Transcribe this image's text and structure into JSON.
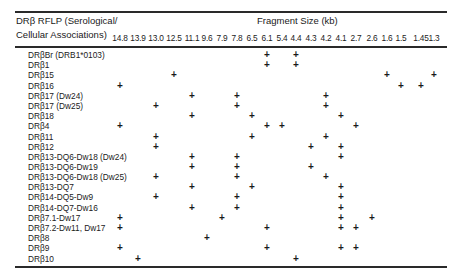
{
  "table": {
    "header_left_line1": "DRβ RFLP (Serological/",
    "header_left_line2": "Cellular Associations)",
    "header_right": "Fragment Size (kb)",
    "columns": [
      {
        "label": "14.8",
        "x": 120
      },
      {
        "label": "13.9",
        "x": 138
      },
      {
        "label": "13.0",
        "x": 156
      },
      {
        "label": "12.5",
        "x": 174
      },
      {
        "label": "11.1",
        "x": 192
      },
      {
        "label": "9.6",
        "x": 207
      },
      {
        "label": "7.9",
        "x": 222
      },
      {
        "label": "7.8",
        "x": 237
      },
      {
        "label": "6.5",
        "x": 252
      },
      {
        "label": "6.1",
        "x": 267
      },
      {
        "label": "5.4",
        "x": 282
      },
      {
        "label": "4.4",
        "x": 296
      },
      {
        "label": "4.3",
        "x": 311
      },
      {
        "label": "4.2",
        "x": 326
      },
      {
        "label": "4.1",
        "x": 341
      },
      {
        "label": "2.7",
        "x": 356
      },
      {
        "label": "2.6",
        "x": 372
      },
      {
        "label": "1.6",
        "x": 387
      },
      {
        "label": "1.5",
        "x": 401
      },
      {
        "label": "1.45",
        "x": 421
      },
      {
        "label": "1.3",
        "x": 434
      }
    ],
    "rows": [
      {
        "label": "DRβBr (DRB1*0103)",
        "y": 55,
        "fragments": [
          "6.1",
          "4.4"
        ]
      },
      {
        "label": "DRβ1",
        "y": 65,
        "fragments": [
          "6.1",
          "4.4"
        ]
      },
      {
        "label": "DRβ15",
        "y": 75,
        "fragments": [
          "12.5",
          "1.6",
          "1.3"
        ]
      },
      {
        "label": "DRβ16",
        "y": 86,
        "fragments": [
          "14.8",
          "1.5",
          "1.45"
        ]
      },
      {
        "label": "DRβ17 (Dw24)",
        "y": 96,
        "fragments": [
          "11.1",
          "7.8",
          "4.2"
        ]
      },
      {
        "label": "DRβ17 (Dw25)",
        "y": 106,
        "fragments": [
          "13.0",
          "7.8",
          "4.2"
        ]
      },
      {
        "label": "DRβ18",
        "y": 116,
        "fragments": [
          "11.1",
          "6.5",
          "4.1"
        ]
      },
      {
        "label": "DRβ4",
        "y": 126,
        "fragments": [
          "14.8",
          "6.1",
          "5.4",
          "2.7"
        ]
      },
      {
        "label": "DRβ11",
        "y": 137,
        "fragments": [
          "13.0",
          "6.5",
          "4.2"
        ]
      },
      {
        "label": "DRβ12",
        "y": 147,
        "fragments": [
          "13.0",
          "4.3",
          "4.1"
        ]
      },
      {
        "label": "DRβ13-DQ6-Dw18 (Dw24)",
        "y": 157,
        "fragments": [
          "11.1",
          "7.8",
          "4.1"
        ]
      },
      {
        "label": "DRβ13-DQ6-Dw19",
        "y": 167,
        "fragments": [
          "11.1",
          "7.8",
          "4.3"
        ]
      },
      {
        "label": "DRβ13-DQ6-Dw18 (Dw25)",
        "y": 177,
        "fragments": [
          "13.0",
          "7.8",
          "4.2"
        ]
      },
      {
        "label": "DRβ13-DQ7",
        "y": 187,
        "fragments": [
          "11.1",
          "6.5",
          "4.1"
        ]
      },
      {
        "label": "DRβ14-DQ5-Dw9",
        "y": 197,
        "fragments": [
          "13.0",
          "7.8",
          "4.1"
        ]
      },
      {
        "label": "DRβ14-DQ7-Dw16",
        "y": 208,
        "fragments": [
          "11.1",
          "7.8",
          "4.1"
        ]
      },
      {
        "label": "DRβ7.1-Dw17",
        "y": 218,
        "fragments": [
          "14.8",
          "7.9",
          "4.1",
          "2.6"
        ]
      },
      {
        "label": "DRβ7.2-Dw11, Dw17",
        "y": 228,
        "fragments": [
          "14.8",
          "6.1",
          "4.1",
          "2.7"
        ]
      },
      {
        "label": "DRβ8",
        "y": 238,
        "fragments": [
          "9.6"
        ]
      },
      {
        "label": "DRβ9",
        "y": 248,
        "fragments": [
          "14.8",
          "6.1",
          "4.1",
          "2.7"
        ]
      },
      {
        "label": "DRβ10",
        "y": 259,
        "fragments": [
          "13.9",
          "4.4"
        ]
      }
    ],
    "mark_symbol": "+"
  }
}
